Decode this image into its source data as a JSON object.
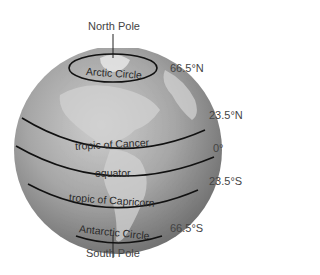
{
  "diagram": {
    "poles": {
      "north": "North Pole",
      "south": "South Pole"
    },
    "circles": [
      {
        "name": "Arctic Circle",
        "latitude": "66.5°N"
      },
      {
        "name": "tropic of Cancer",
        "latitude": "23.5°N"
      },
      {
        "name": "equator",
        "latitude": "0°"
      },
      {
        "name": "tropic of Capricorn",
        "latitude": "23.5°S"
      },
      {
        "name": "Antarctic Circle",
        "latitude": "66.5°S"
      }
    ],
    "colors": {
      "globe_light": "#c9c9c9",
      "globe_mid": "#9a9a9a",
      "globe_dark": "#6e6e6e",
      "land": "#d8d8d8",
      "line": "#111111",
      "label_text": "#444444"
    }
  }
}
